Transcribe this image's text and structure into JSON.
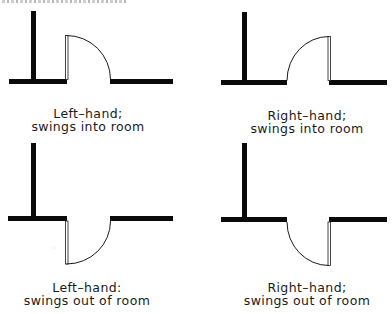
{
  "diagram": {
    "colors": {
      "wall": "#0a0a0a",
      "door": "#1a1a1a",
      "background": "#ffffff"
    },
    "panels": [
      {
        "id": "left-hand-in",
        "line1": "Left–hand;",
        "line2": "swings into room"
      },
      {
        "id": "right-hand-in",
        "line1": "Right–hand;",
        "line2": "swings into room"
      },
      {
        "id": "left-hand-out",
        "line1": "Left–hand:",
        "line2": "swings out of room"
      },
      {
        "id": "right-hand-out",
        "line1": "Right–hand;",
        "line2": "swings out of room"
      }
    ]
  }
}
